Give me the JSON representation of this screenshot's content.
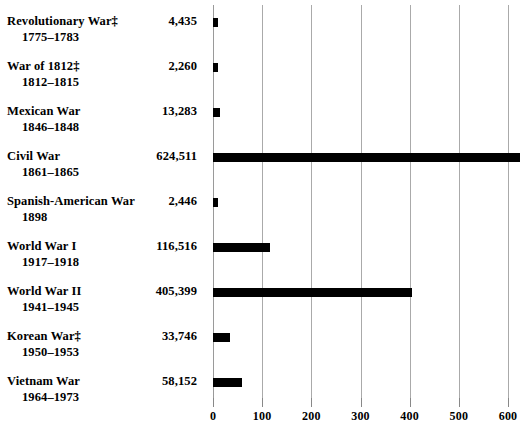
{
  "chart_data": {
    "type": "bar",
    "orientation": "horizontal",
    "title": "",
    "subtitle": "",
    "xlabel": "",
    "ylabel": "",
    "xlim": [
      0,
      640
    ],
    "x_unit": "thousands",
    "xticks": [
      0,
      100,
      200,
      300,
      400,
      500,
      600
    ],
    "xticklabels": [
      "0",
      "100",
      "200",
      "300",
      "400",
      "500",
      "600"
    ],
    "grid": true,
    "legend": false,
    "categories": [
      "Revolutionary War‡",
      "War of 1812‡",
      "Mexican War",
      "Civil War",
      "Spanish-American War",
      "World War I",
      "World War II",
      "Korean War‡",
      "Vietnam War"
    ],
    "values": [
      4435,
      2260,
      13283,
      624511,
      2446,
      116516,
      405399,
      33746,
      58152
    ],
    "value_labels": [
      "4,435",
      "2,260",
      "13,283",
      "624,511",
      "2,446",
      "116,516",
      "405,399",
      "33,746",
      "58,152"
    ],
    "period_labels": [
      "1775–1783",
      "1812–1815",
      "1846–1848",
      "1861–1865",
      "1898",
      "1917–1918",
      "1941–1945",
      "1950–1953",
      "1964–1973"
    ],
    "bar_color": "#000000",
    "grid_color": "#aaaaaa"
  },
  "rows": [
    {
      "name": "Revolutionary War‡",
      "years": "1775–1783",
      "value_label": "4,435",
      "value": 4435
    },
    {
      "name": "War of 1812‡",
      "years": "1812–1815",
      "value_label": "2,260",
      "value": 2260
    },
    {
      "name": "Mexican War",
      "years": "1846–1848",
      "value_label": "13,283",
      "value": 13283
    },
    {
      "name": "Civil War",
      "years": "1861–1865",
      "value_label": "624,511",
      "value": 624511
    },
    {
      "name": "Spanish-American War",
      "years": "1898",
      "value_label": "2,446",
      "value": 2446
    },
    {
      "name": "World War I",
      "years": "1917–1918",
      "value_label": "116,516",
      "value": 116516
    },
    {
      "name": "World War II",
      "years": "1941–1945",
      "value_label": "405,399",
      "value": 405399
    },
    {
      "name": "Korean War‡",
      "years": "1950–1953",
      "value_label": "33,746",
      "value": 33746
    },
    {
      "name": "Vietnam War",
      "years": "1964–1973",
      "value_label": "58,152",
      "value": 58152
    }
  ],
  "axis": {
    "ticks": [
      "0",
      "100",
      "200",
      "300",
      "400",
      "500",
      "600"
    ]
  }
}
